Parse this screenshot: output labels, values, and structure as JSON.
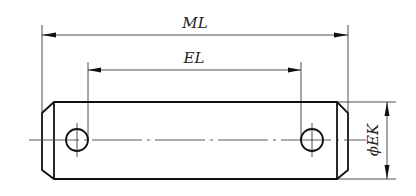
{
  "drawing": {
    "type": "technical-drawing",
    "subject": "pin with two cross holes",
    "dimensions": {
      "overall_length": {
        "label": "ML"
      },
      "hole_spacing": {
        "label": "EL"
      },
      "diameter": {
        "label": "ϕEK"
      }
    },
    "colors": {
      "line": "#111111",
      "background": "#ffffff"
    }
  }
}
